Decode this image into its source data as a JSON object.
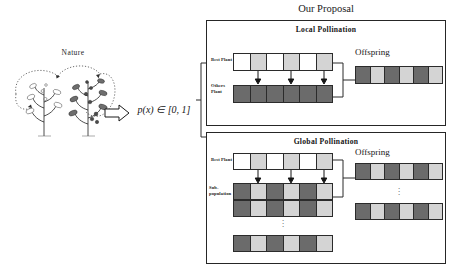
{
  "figure": {
    "nature_label": "Nature",
    "formula": "p(x) ∈ [0, 1]",
    "proposal_title": "Our Proposal"
  },
  "palette": {
    "white_gene": "#ffffff",
    "light_gene": "#d4d4d4",
    "mid_gene": "#b8b8b8",
    "dark_gene": "#6b6b6b",
    "stroke": "#2b2b2b",
    "text": "#1a1a1a"
  },
  "local_pollination": {
    "title": "Local Pollination",
    "best_plant_label": "Best Plant",
    "others_plant_label": "Others\nPlant",
    "offspring_label": "Offspring",
    "best_plant_cells": [
      "white",
      "light",
      "white",
      "light",
      "white",
      "light"
    ],
    "others_plant_cells": [
      "dark",
      "dark",
      "dark",
      "dark",
      "dark",
      "dark"
    ],
    "offspring_cells": [
      "dark",
      "light",
      "dark",
      "light",
      "dark",
      "light"
    ],
    "arrow_count": 3
  },
  "global_pollination": {
    "title": "Global  Pollination",
    "best_plant_label": "Best Plant",
    "subpopulation_label": "Sub-\npopulation",
    "offspring_label": "Offspring",
    "best_plant_cells": [
      "white",
      "light",
      "white",
      "light",
      "white",
      "light"
    ],
    "subpopulation_rows": [
      [
        "dark",
        "light",
        "dark",
        "light",
        "dark",
        "light"
      ],
      [
        "dark",
        "light",
        "dark",
        "light",
        "dark",
        "light"
      ],
      [
        "dark",
        "light",
        "dark",
        "light",
        "dark",
        "light"
      ]
    ],
    "offspring_rows": [
      [
        "dark",
        "light",
        "dark",
        "light",
        "dark",
        "light"
      ],
      [
        "dark",
        "light",
        "dark",
        "light",
        "dark",
        "light"
      ]
    ],
    "ellipsis": "·\n·\n·",
    "arrow_count": 3
  }
}
